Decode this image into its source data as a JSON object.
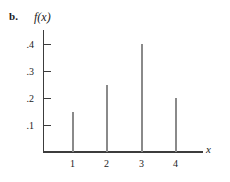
{
  "figure": {
    "panel_label": "b.",
    "background_color": "#ffffff",
    "width": 230,
    "height": 182
  },
  "chart_data": {
    "type": "bar",
    "title": "",
    "subtitle": "",
    "xlabel": "x",
    "ylabel": "f(x)",
    "categories": [
      "1",
      "2",
      "3",
      "4"
    ],
    "x": [
      1,
      2,
      3,
      4
    ],
    "values": [
      0.15,
      0.25,
      0.4,
      0.2
    ],
    "xlim": [
      0,
      4.8
    ],
    "ylim": [
      0,
      0.45
    ],
    "xticks": [
      1,
      2,
      3,
      4
    ],
    "xtick_labels": [
      "1",
      "2",
      "3",
      "4"
    ],
    "yticks": [
      0.1,
      0.2,
      0.3,
      0.4
    ],
    "ytick_labels": [
      ".1",
      ".2",
      ".3",
      ".4"
    ],
    "grid": false,
    "legend": null,
    "bar_color": "#8a8a8a",
    "axis_color": "#3c3c3c",
    "annotations": []
  }
}
